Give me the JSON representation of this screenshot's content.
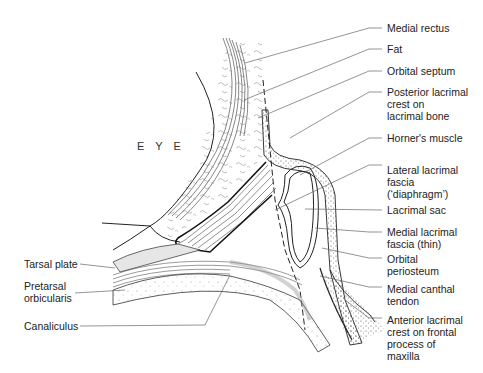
{
  "diagram": {
    "region_label": "E Y E",
    "labels_right": [
      {
        "id": "medial-rectus",
        "text": "Medial rectus"
      },
      {
        "id": "fat",
        "text": "Fat"
      },
      {
        "id": "orbital-septum",
        "text": "Orbital septum"
      },
      {
        "id": "posterior-lacrimal-crest",
        "text": "Posterior lacrimal\ncrest on\nlacrimal bone"
      },
      {
        "id": "horners-muscle",
        "text": "Horner's muscle"
      },
      {
        "id": "lateral-lacrimal-fascia",
        "text": "Lateral lacrimal\nfascia\n(‘diaphragm’)"
      },
      {
        "id": "lacrimal-sac",
        "text": "Lacrimal sac"
      },
      {
        "id": "medial-lacrimal-fascia",
        "text": "Medial lacrimal\nfascia (thin)"
      },
      {
        "id": "orbital-periosteum",
        "text": "Orbital\nperiosteum"
      },
      {
        "id": "medial-canthal-tendon",
        "text": "Medial canthal\ntendon"
      },
      {
        "id": "anterior-lacrimal-crest",
        "text": "Anterior lacrimal\ncrest on frontal\nprocess of\nmaxilla"
      }
    ],
    "labels_left": [
      {
        "id": "tarsal-plate",
        "text": "Tarsal plate"
      },
      {
        "id": "pretarsal-orbicularis",
        "text": "Pretarsal\norbicularis"
      },
      {
        "id": "canaliculus",
        "text": "Canaliculus"
      }
    ]
  }
}
